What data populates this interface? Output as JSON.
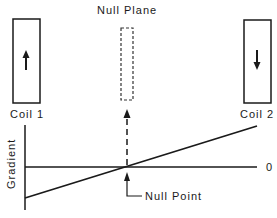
{
  "diagram": {
    "title_label": "Null Plane",
    "coil1": {
      "label": "Coil 1",
      "field_direction": "up"
    },
    "coil2": {
      "label": "Coil 2",
      "field_direction": "down"
    },
    "axis": {
      "ylabel": "Gradient",
      "zero_label": "0"
    },
    "null_point_label": "Null Point",
    "icons": {
      "coil1_arrow": "arrow-up-icon",
      "coil2_arrow": "arrow-down-icon",
      "null_plane_arrow": "dashed-arrow-up-icon",
      "null_point_arrow": "elbow-arrow-up-icon"
    },
    "colors": {
      "ink": "#1a1a1a",
      "background": "#ffffff"
    }
  }
}
